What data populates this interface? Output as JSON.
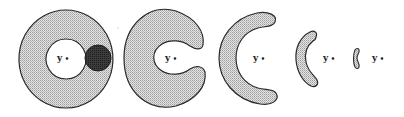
{
  "figure": {
    "colors": {
      "fill_pattern_light": "#d9d9d9",
      "fill_pattern_dark": "#b5b5b5",
      "outline": "#2a2a2a",
      "blob": "#3a3a3a",
      "background": "#ffffff"
    },
    "shapes": [
      {
        "id": 1,
        "type": "annulus-with-blob",
        "label": "y"
      },
      {
        "id": 2,
        "type": "thick-c-shape",
        "label": "y"
      },
      {
        "id": 3,
        "type": "crescent",
        "label": "y"
      },
      {
        "id": 4,
        "type": "thin-crescent",
        "label": "y"
      },
      {
        "id": 5,
        "type": "sliver",
        "label": "y"
      }
    ]
  }
}
